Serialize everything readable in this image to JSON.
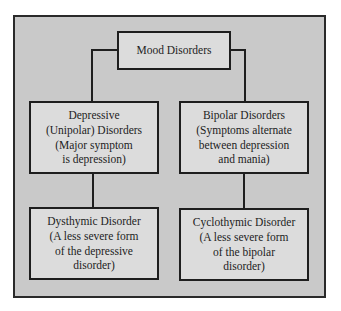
{
  "diagram": {
    "type": "hierarchy",
    "root": {
      "label": "Mood Disorders"
    },
    "branches": [
      {
        "lines": [
          "Depressive",
          "(Unipolar) Disorders",
          "(Major symptom",
          "is depression)"
        ],
        "child": {
          "lines": [
            "Dysthymic Disorder",
            "(A less severe form",
            "of the depressive",
            "disorder)"
          ]
        }
      },
      {
        "lines": [
          "Bipolar Disorders",
          "(Symptoms alternate",
          "between depression",
          "and mania)"
        ],
        "child": {
          "lines": [
            "Cyclothymic Disorder",
            "(A less severe form",
            "of the bipolar",
            "disorder)"
          ]
        }
      }
    ],
    "colors": {
      "frame_bg": "#c9c9c9",
      "box_bg": "#dcdcdc",
      "stroke": "#1e1e1e"
    }
  }
}
